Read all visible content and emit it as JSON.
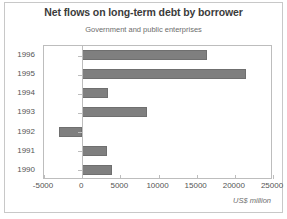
{
  "chart_data": {
    "type": "bar",
    "orientation": "horizontal",
    "title": "Net flows on long-term debt by borrower",
    "subtitle": "Government and public enterprises",
    "xlabel": "US$ million",
    "ylabel": "",
    "categories": [
      "1996",
      "1995",
      "1994",
      "1993",
      "1992",
      "1991",
      "1990"
    ],
    "values": [
      16300,
      21500,
      3400,
      8500,
      -3000,
      3300,
      3900
    ],
    "series": [
      {
        "name": "Government and public enterprises",
        "values": [
          16300,
          21500,
          3400,
          8500,
          -3000,
          3300,
          3900
        ]
      }
    ],
    "xlim": [
      -5000,
      25000
    ],
    "xticks": [
      -5000,
      0,
      5000,
      10000,
      15000,
      20000,
      25000
    ],
    "xtick_labels": [
      "-5000",
      "0",
      "5000",
      "10000",
      "15000",
      "20000",
      "25000"
    ],
    "grid": false,
    "legend": false,
    "bar_color": "#7f7f7f",
    "axis_color": "#bdbdbd",
    "title_color": "#3b3b3b",
    "subtitle_color": "#6d6d6d",
    "label_color": "#555555",
    "background": "#ffffff"
  }
}
